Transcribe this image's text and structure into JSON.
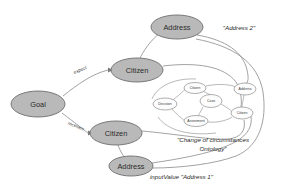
{
  "diagram": {
    "colors": {
      "node_fill": "#b9b9b9",
      "node_stroke": "#6d6d6d",
      "small_node_fill": "#fdfdfd",
      "small_node_stroke": "#8d8d8d",
      "edge": "#8a8a8a",
      "text": "#2b2b2b",
      "background": "#ffffff"
    },
    "nodes": [
      {
        "id": "goal",
        "label": "Goal",
        "kind": "big",
        "cx": 38,
        "cy": 104,
        "rx": 27,
        "ry": 13
      },
      {
        "id": "citizen_top",
        "label": "Citizen",
        "kind": "big",
        "cx": 137,
        "cy": 70,
        "rx": 26,
        "ry": 12
      },
      {
        "id": "citizen_bottom",
        "label": "Citizen",
        "kind": "big",
        "cx": 116,
        "cy": 133,
        "rx": 26,
        "ry": 12
      },
      {
        "id": "address_top",
        "label": "Address",
        "kind": "big",
        "cx": 177,
        "cy": 27,
        "rx": 26,
        "ry": 12
      },
      {
        "id": "address_bottom",
        "label": "Address",
        "kind": "big",
        "cx": 131,
        "cy": 166,
        "rx": 22,
        "ry": 10
      },
      {
        "id": "decision",
        "label": "Decision",
        "kind": "small",
        "cx": 165,
        "cy": 104,
        "rx": 12,
        "ry": 6
      },
      {
        "id": "citizen_onto",
        "label": "Citizen",
        "kind": "small",
        "cx": 195,
        "cy": 88,
        "rx": 11,
        "ry": 5.5
      },
      {
        "id": "case",
        "label": "Case",
        "kind": "small",
        "cx": 211,
        "cy": 101,
        "rx": 11,
        "ry": 6.5
      },
      {
        "id": "assesment",
        "label": "Assesment",
        "kind": "small",
        "cx": 196,
        "cy": 121,
        "rx": 12,
        "ry": 5.5
      },
      {
        "id": "address_onto",
        "label": "Address",
        "kind": "small",
        "cx": 245,
        "cy": 89,
        "rx": 11,
        "ry": 6
      },
      {
        "id": "citizen_onto2",
        "label": "Citizen",
        "kind": "small",
        "cx": 242,
        "cy": 113,
        "rx": 11,
        "ry": 6
      }
    ],
    "edge_labels": [
      {
        "id": "expect",
        "text": "expect",
        "x": 80,
        "y": 70,
        "rotate": -22
      },
      {
        "id": "receives",
        "text": "receives",
        "x": 76,
        "y": 126,
        "rotate": 22
      }
    ],
    "annotations": [
      {
        "id": "address-2-annotation",
        "text": "\"Address 2\"",
        "x": 239,
        "y": 27
      },
      {
        "id": "ontology-annotation-line1",
        "text": "\"Change of circumstances",
        "x": 213,
        "y": 139
      },
      {
        "id": "ontology-annotation-line2",
        "text": "Ontology\"",
        "x": 213,
        "y": 148
      },
      {
        "id": "input-value-annotation",
        "text": "inputValue \"Address 1\"",
        "x": 150,
        "y": 176
      }
    ]
  }
}
